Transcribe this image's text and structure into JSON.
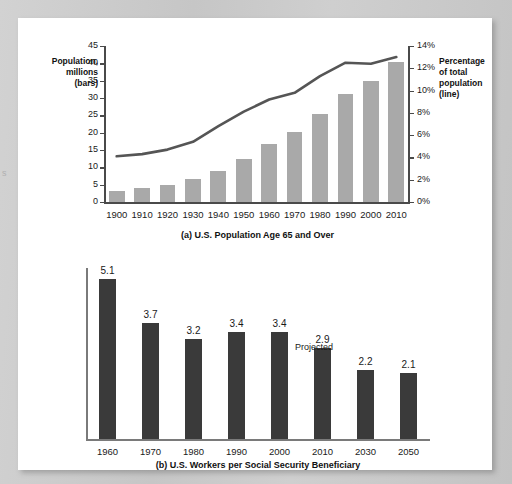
{
  "edge_fragment": "s",
  "chart_data": [
    {
      "id": "panel_a",
      "type": "bar",
      "title": "(a) U.S. Population Age 65 and Over",
      "left_axis_label": "Population,\nmillions\n(bars)",
      "left_axis_label_lines": [
        "Population,",
        "millions",
        "(bars)"
      ],
      "right_axis_label_lines": [
        "Percentage",
        "of total",
        "population",
        "(line)"
      ],
      "xlabel": "",
      "ylabel": "Population, millions (bars)",
      "y2label": "Percentage of total population (line)",
      "ylim": [
        0,
        45
      ],
      "y2lim": [
        0,
        14
      ],
      "yticks": [
        0,
        5,
        10,
        15,
        20,
        25,
        30,
        35,
        40,
        45
      ],
      "ytick_labels": [
        "0",
        "5",
        "10",
        "15",
        "20",
        "25",
        "30",
        "35",
        "40",
        "45"
      ],
      "y2ticks": [
        0,
        2,
        4,
        6,
        8,
        10,
        12,
        14
      ],
      "y2tick_labels": [
        "0%",
        "2%",
        "4%",
        "6%",
        "8%",
        "10%",
        "12%",
        "14%"
      ],
      "grid": false,
      "legend": "none",
      "categories": [
        "1900",
        "1910",
        "1920",
        "1930",
        "1940",
        "1950",
        "1960",
        "1970",
        "1980",
        "1990",
        "2000",
        "2010"
      ],
      "series": [
        {
          "name": "Population age 65 and over (millions)",
          "kind": "bar",
          "color": "#a9a9a9",
          "values": [
            3.1,
            3.9,
            4.9,
            6.6,
            9.0,
            12.3,
            16.6,
            20.1,
            25.5,
            31.2,
            35.0,
            40.3
          ]
        },
        {
          "name": "Percentage of total population",
          "kind": "line",
          "color": "#555555",
          "values": [
            4.1,
            4.3,
            4.7,
            5.4,
            6.8,
            8.1,
            9.2,
            9.8,
            11.3,
            12.5,
            12.4,
            13.0
          ]
        }
      ]
    },
    {
      "id": "panel_b",
      "type": "bar",
      "title": "(b) U.S. Workers per Social Security Beneficiary",
      "xlabel": "",
      "ylabel": "",
      "ylim": [
        0,
        5.1
      ],
      "grid": false,
      "legend": "none",
      "annotation": "Projected",
      "annotation_over": [
        "2030",
        "2050"
      ],
      "categories": [
        "1960",
        "1970",
        "1980",
        "1990",
        "2000",
        "2010",
        "2030",
        "2050"
      ],
      "values": [
        5.1,
        3.7,
        3.2,
        3.4,
        3.4,
        2.9,
        2.2,
        2.1
      ],
      "value_labels": [
        "5.1",
        "3.7",
        "3.2",
        "3.4",
        "3.4",
        "2.9",
        "2.2",
        "2.1"
      ],
      "bar_color": "#3a3a3a"
    }
  ]
}
